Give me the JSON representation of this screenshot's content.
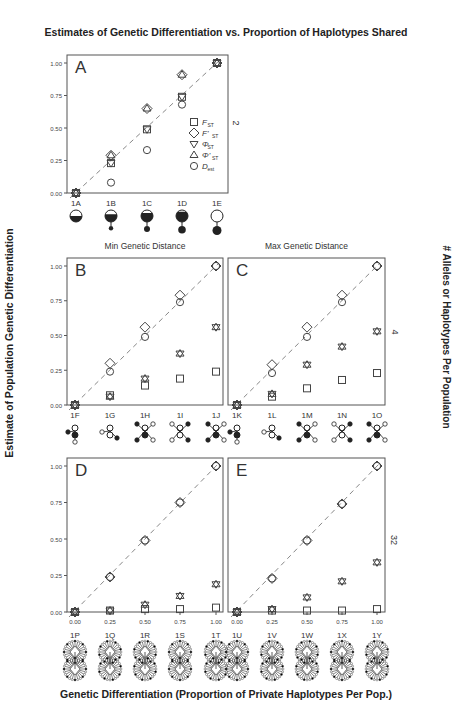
{
  "figure": {
    "title": "Estimates of Genetic Differentiation vs. Proportion of Haplotypes Shared",
    "ylabel": "Estimate of Population Genetic Differentiation",
    "right_label": "# Alleles or Haplotypes Per Population",
    "xlabel": "Genetic Differentiation (Proportion of Private Haplotypes Per Pop.)",
    "subtitle_left": "Min Genetic Distance",
    "subtitle_right": "Max Genetic Distance",
    "row_counts": [
      "2",
      "4",
      "32"
    ],
    "legend": [
      {
        "symbol": "square",
        "label": "F",
        "sub": "ST"
      },
      {
        "symbol": "diamond",
        "label": "F'",
        "sub": "ST"
      },
      {
        "symbol": "triangle-down",
        "label": "Φ",
        "sub": "ST"
      },
      {
        "symbol": "triangle-up",
        "label": "Φ'",
        "sub": "ST"
      },
      {
        "symbol": "circle",
        "label": "D",
        "sub": "est"
      }
    ],
    "colors": {
      "axis": "#555555",
      "marker": "#444444",
      "diagonal": "#888888"
    }
  },
  "chart_data": [
    {
      "panel": "A",
      "type": "scatter",
      "title": "",
      "categories": [
        "1A",
        "1B",
        "1C",
        "1D",
        "1E"
      ],
      "x": [
        0,
        0.25,
        0.5,
        0.75,
        1.0
      ],
      "yticks": [
        "0.00",
        "0.25",
        "0.50",
        "0.75",
        "1.00"
      ],
      "ylim": [
        0,
        1
      ],
      "series": [
        {
          "name": "FST",
          "values": [
            0,
            0.23,
            0.49,
            0.74,
            1.0
          ]
        },
        {
          "name": "F'ST",
          "values": [
            0,
            0.29,
            0.65,
            0.91,
            1.0
          ]
        },
        {
          "name": "ΦST",
          "values": [
            0,
            0.23,
            0.49,
            0.74,
            1.0
          ]
        },
        {
          "name": "Φ'ST",
          "values": [
            0,
            0.29,
            0.65,
            0.91,
            1.0
          ]
        },
        {
          "name": "Dest",
          "values": [
            0,
            0.08,
            0.33,
            0.68,
            1.0
          ]
        }
      ],
      "diagonal": true,
      "alleles_per_population": 2
    },
    {
      "panel": "B",
      "type": "scatter",
      "title": "Min Genetic Distance",
      "categories": [
        "1F",
        "1G",
        "1H",
        "1I",
        "1J"
      ],
      "x": [
        0,
        0.25,
        0.5,
        0.75,
        1.0
      ],
      "yticks": [
        "0.00",
        "0.25",
        "0.50",
        "0.75",
        "1.00"
      ],
      "ylim": [
        0,
        1
      ],
      "series": [
        {
          "name": "FST",
          "values": [
            0,
            0.07,
            0.14,
            0.19,
            0.24
          ]
        },
        {
          "name": "F'ST",
          "values": [
            0,
            0.3,
            0.56,
            0.79,
            1.0
          ]
        },
        {
          "name": "ΦST",
          "values": [
            0,
            0.06,
            0.19,
            0.37,
            0.56
          ]
        },
        {
          "name": "Φ'ST",
          "values": [
            0,
            0.06,
            0.19,
            0.37,
            0.56
          ]
        },
        {
          "name": "Dest",
          "values": [
            0,
            0.24,
            0.49,
            0.74,
            1.0
          ]
        }
      ],
      "diagonal": true,
      "alleles_per_population": 4
    },
    {
      "panel": "C",
      "type": "scatter",
      "title": "Max Genetic Distance",
      "categories": [
        "1K",
        "1L",
        "1M",
        "1N",
        "1O"
      ],
      "x": [
        0,
        0.25,
        0.5,
        0.75,
        1.0
      ],
      "ylim": [
        0,
        1
      ],
      "series": [
        {
          "name": "FST",
          "values": [
            0,
            0.06,
            0.12,
            0.18,
            0.23
          ]
        },
        {
          "name": "F'ST",
          "values": [
            0,
            0.29,
            0.56,
            0.79,
            1.0
          ]
        },
        {
          "name": "ΦST",
          "values": [
            0,
            0.08,
            0.29,
            0.42,
            0.53
          ]
        },
        {
          "name": "Φ'ST",
          "values": [
            0,
            0.08,
            0.29,
            0.42,
            0.53
          ]
        },
        {
          "name": "Dest",
          "values": [
            0,
            0.23,
            0.49,
            0.74,
            1.0
          ]
        }
      ],
      "diagonal": true,
      "alleles_per_population": 4
    },
    {
      "panel": "D",
      "type": "scatter",
      "title": "",
      "categories": [
        "1P",
        "1Q",
        "1R",
        "1S",
        "1T"
      ],
      "x": [
        0,
        0.25,
        0.5,
        0.75,
        1.0
      ],
      "xticks": [
        "0.00",
        "0.25",
        "0.50",
        "0.75",
        "1.00"
      ],
      "yticks": [
        "0.00",
        "0.25",
        "0.50",
        "0.75",
        "1.00"
      ],
      "ylim": [
        0,
        1
      ],
      "series": [
        {
          "name": "FST",
          "values": [
            0,
            0.01,
            0.02,
            0.02,
            0.03
          ]
        },
        {
          "name": "F'ST",
          "values": [
            0,
            0.24,
            0.49,
            0.75,
            1.0
          ]
        },
        {
          "name": "ΦST",
          "values": [
            0,
            0.01,
            0.05,
            0.11,
            0.19
          ]
        },
        {
          "name": "Φ'ST",
          "values": [
            0,
            0.01,
            0.05,
            0.11,
            0.19
          ]
        },
        {
          "name": "Dest",
          "values": [
            0,
            0.24,
            0.49,
            0.75,
            1.0
          ]
        }
      ],
      "diagonal": true,
      "alleles_per_population": 32
    },
    {
      "panel": "E",
      "type": "scatter",
      "title": "",
      "categories": [
        "1U",
        "1V",
        "1W",
        "1X",
        "1Y"
      ],
      "x": [
        0,
        0.25,
        0.5,
        0.75,
        1.0
      ],
      "xticks": [
        "0.00",
        "0.25",
        "0.50",
        "0.75",
        "1.00"
      ],
      "ylim": [
        0,
        1
      ],
      "series": [
        {
          "name": "FST",
          "values": [
            0,
            0.01,
            0.01,
            0.01,
            0.02
          ]
        },
        {
          "name": "F'ST",
          "values": [
            0,
            0.23,
            0.49,
            0.74,
            1.0
          ]
        },
        {
          "name": "ΦST",
          "values": [
            0,
            0.02,
            0.1,
            0.21,
            0.34
          ]
        },
        {
          "name": "Φ'ST",
          "values": [
            0,
            0.02,
            0.1,
            0.21,
            0.34
          ]
        },
        {
          "name": "Dest",
          "values": [
            0,
            0.23,
            0.49,
            0.74,
            1.0
          ]
        }
      ],
      "diagonal": true,
      "alleles_per_population": 32
    }
  ]
}
